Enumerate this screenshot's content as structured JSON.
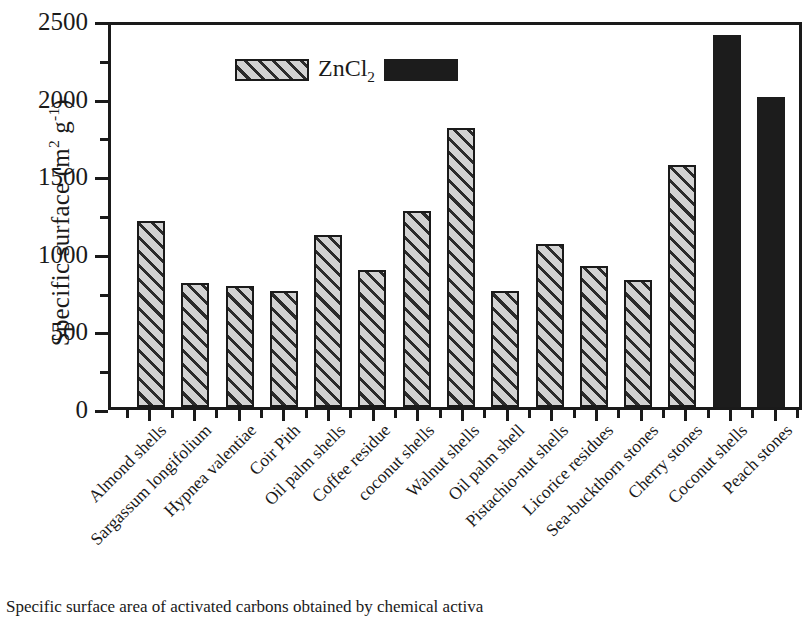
{
  "axis": {
    "ylabel_prefix": "Specific surface (m",
    "ylabel_sup1": "2",
    "ylabel_mid": " g",
    "ylabel_sup2": "-1",
    "ylabel_suffix": ")",
    "ytick_labels": [
      "0",
      "500",
      "1000",
      "1500",
      "2000",
      "2500"
    ]
  },
  "legend": {
    "hatch_swatch_name": "hatched-pattern-swatch",
    "label": "ZnCl",
    "label_sub": "2",
    "solid_swatch_name": "solid-black-swatch"
  },
  "caption": {
    "text": "Specific surface area of activated carbons obtained by chemical activa"
  },
  "chart_data": {
    "type": "bar",
    "title": "",
    "xlabel": "",
    "ylabel": "Specific surface (m2 g-1)",
    "ylim": [
      0,
      2500
    ],
    "ytick_values": [
      0,
      500,
      1000,
      1500,
      2000,
      2500
    ],
    "yminor_tick_values": [
      250,
      750,
      1250,
      1750,
      2250
    ],
    "grid": false,
    "legend_position": "top-left inside axes",
    "legend_entries": [
      "ZnCl2 (hatched)",
      "(solid black)"
    ],
    "categories": [
      "Almond shells",
      "Sargassum longifolium",
      "Hypnea valentiae",
      "Coir Pith",
      "Oil palm shells",
      "Coffee residue",
      "coconut shells",
      "Walnut shells",
      "Oil palm shell",
      "Pistachio-nut shells",
      "Licorice residues",
      "Sea-buckthorn stones",
      "Cherry stones",
      "Coconut shells",
      "Peach stones"
    ],
    "values": [
      1200,
      800,
      780,
      750,
      1110,
      880,
      1260,
      1800,
      750,
      1050,
      910,
      820,
      1560,
      2400,
      2000
    ],
    "styles": [
      "hatch",
      "hatch",
      "hatch",
      "hatch",
      "hatch",
      "hatch",
      "hatch",
      "hatch",
      "hatch",
      "hatch",
      "hatch",
      "hatch",
      "hatch",
      "solid",
      "solid"
    ],
    "colors": {
      "hatch_fill": "#d2d2d2",
      "hatch_line": "#2b2b2b",
      "solid_fill": "#1c1c1c",
      "outline": "#1a1a1a"
    }
  }
}
